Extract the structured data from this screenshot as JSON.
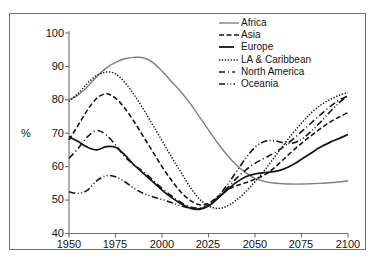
{
  "chart_data": {
    "type": "line",
    "title": "",
    "subtitle": "",
    "xlabel": "",
    "ylabel": "%",
    "xlim": [
      1950,
      2100
    ],
    "ylim": [
      40,
      100
    ],
    "xticks": [
      1950,
      1975,
      2000,
      2025,
      2050,
      2075,
      2100
    ],
    "yticks": [
      40,
      50,
      60,
      70,
      80,
      90,
      100
    ],
    "grid": false,
    "legend_position": "top-right",
    "x": [
      1950,
      1955,
      1960,
      1965,
      1970,
      1975,
      1980,
      1985,
      1990,
      1995,
      2000,
      2005,
      2010,
      2015,
      2020,
      2025,
      2030,
      2035,
      2040,
      2045,
      2050,
      2055,
      2060,
      2065,
      2070,
      2075,
      2080,
      2085,
      2090,
      2095,
      2100
    ],
    "series": [
      {
        "name": "Africa",
        "style": "solid",
        "color": "#808080",
        "values": [
          80.0,
          81.5,
          84.0,
          87.0,
          89.5,
          91.2,
          92.3,
          92.7,
          92.6,
          91.2,
          88.6,
          85.5,
          82.5,
          79.0,
          75.0,
          71.0,
          67.0,
          63.5,
          60.5,
          58.2,
          56.5,
          55.6,
          55.1,
          54.9,
          54.8,
          54.8,
          54.9,
          55.0,
          55.2,
          55.4,
          55.8
        ]
      },
      {
        "name": "Asia",
        "style": "dashed",
        "color": "#141414",
        "values": [
          68.0,
          72.5,
          77.0,
          80.5,
          81.8,
          80.5,
          77.5,
          73.5,
          69.0,
          64.5,
          60.0,
          56.0,
          52.5,
          50.0,
          48.6,
          49.0,
          51.0,
          53.0,
          54.3,
          55.2,
          56.2,
          57.5,
          59.5,
          62.0,
          64.6,
          67.0,
          69.2,
          71.3,
          73.2,
          74.8,
          76.2
        ]
      },
      {
        "name": "Europe",
        "style": "solid-black",
        "color": "#141414",
        "values": [
          69.0,
          67.5,
          65.8,
          65.0,
          66.0,
          65.8,
          63.5,
          60.5,
          58.0,
          55.5,
          53.0,
          50.8,
          49.0,
          47.6,
          47.2,
          48.2,
          50.5,
          53.0,
          55.3,
          57.0,
          57.8,
          58.2,
          58.5,
          59.2,
          60.5,
          62.2,
          64.0,
          65.8,
          67.2,
          68.4,
          69.6
        ]
      },
      {
        "name": "LA & Caribbean",
        "style": "dotted",
        "color": "#141414",
        "values": [
          79.5,
          82.0,
          85.0,
          87.3,
          88.3,
          87.8,
          85.2,
          81.5,
          77.2,
          72.5,
          67.8,
          63.0,
          58.5,
          54.0,
          50.4,
          48.3,
          47.5,
          48.2,
          50.0,
          52.5,
          55.5,
          58.8,
          62.5,
          66.2,
          69.8,
          73.0,
          76.0,
          78.3,
          80.0,
          81.3,
          82.2
        ]
      },
      {
        "name": "North America",
        "style": "dash-dot",
        "color": "#141414",
        "values": [
          62.5,
          65.5,
          69.0,
          70.8,
          69.5,
          66.5,
          63.0,
          60.5,
          58.5,
          56.0,
          53.5,
          51.3,
          49.4,
          48.0,
          47.6,
          48.5,
          50.6,
          53.5,
          56.5,
          59.0,
          61.0,
          62.5,
          64.0,
          65.8,
          68.0,
          70.5,
          73.0,
          75.5,
          77.8,
          79.8,
          81.2
        ]
      },
      {
        "name": "Oceania",
        "style": "dash-dot-dot",
        "color": "#141414",
        "values": [
          52.5,
          52.0,
          53.0,
          55.8,
          57.3,
          57.0,
          55.5,
          53.5,
          52.0,
          51.0,
          50.2,
          49.3,
          48.3,
          47.6,
          47.4,
          48.5,
          51.0,
          54.5,
          58.5,
          62.5,
          65.8,
          67.5,
          67.8,
          67.2,
          67.0,
          68.2,
          70.5,
          73.2,
          76.2,
          79.0,
          81.3
        ]
      }
    ]
  },
  "axes": {
    "y_unit": "%",
    "y_tick_labels": [
      "100",
      "90",
      "80",
      "70",
      "60",
      "50",
      "40"
    ],
    "x_tick_labels": [
      "1950",
      "1975",
      "2000",
      "2025",
      "2050",
      "2075",
      "2100"
    ]
  },
  "legend": {
    "entries": [
      {
        "label": "Africa"
      },
      {
        "label": "Asia"
      },
      {
        "label": "Europe"
      },
      {
        "label": "LA & Caribbean"
      },
      {
        "label": "North America"
      },
      {
        "label": "Oceania"
      }
    ]
  }
}
